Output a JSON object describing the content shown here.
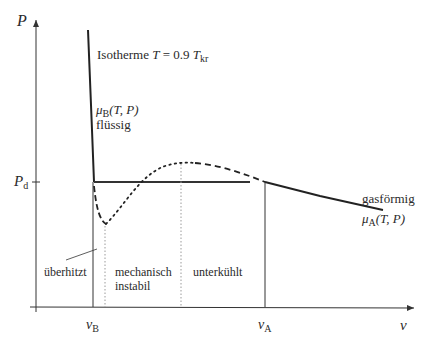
{
  "diagram": {
    "axes": {
      "y_label": "P",
      "x_label": "v",
      "y_tick": {
        "label": "P",
        "sub": "d"
      },
      "x_ticks": [
        {
          "label": "v",
          "sub": "B"
        },
        {
          "label": "v",
          "sub": "A"
        }
      ]
    },
    "title": {
      "prefix": "Isotherme ",
      "var": "T",
      "eq": " = 0.9 ",
      "var2": "T",
      "sub": "kr"
    },
    "liquid": {
      "mu": "μ",
      "mu_sub": "B",
      "args": "(T, P)",
      "state": "flüssig"
    },
    "gas": {
      "state": "gasförmig",
      "mu": "μ",
      "mu_sub": "A",
      "args": "(T, P)"
    },
    "regions": {
      "overheated": "überhitzt",
      "unstable_line1": "mechanisch",
      "unstable_line2": "instabil",
      "undercooled": "unterkühlt"
    },
    "colors": {
      "line": "#2a2a2a",
      "dotted": "#9a9a9a"
    }
  }
}
